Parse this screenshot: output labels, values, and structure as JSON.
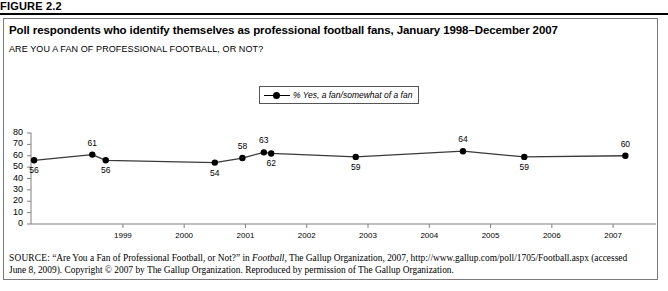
{
  "figure": {
    "label": "FIGURE 2.2",
    "title": "Poll respondents who identify themselves as professional football fans, January 1998–December 2007",
    "subtitle": "ARE YOU A FAN OF PROFESSIONAL FOOTBALL, OR NOT?"
  },
  "legend": {
    "series_label": "% Yes, a fan/somewhat of a fan",
    "position": "top-center"
  },
  "source": {
    "keyword": "SOURCE",
    "text_before_italic": ": “Are You a Fan of Professional Football, or Not?” in ",
    "italic_title": "Football,",
    "text_after_italic": " The Gallup Organization, 2007, http://www.gallup.com/poll/1705/Football.aspx (accessed June 8, 2009). Copyright © 2007 by The Gallup Organization. Reproduced by permission of The Gallup Organization."
  },
  "colors": {
    "line": "#3a3a3a",
    "marker": "#000000",
    "axis": "#808080",
    "border": "#7a7a7a",
    "background": "#ffffff"
  },
  "chart_data": {
    "type": "line",
    "title": "Poll respondents who identify themselves as professional football fans, January 1998–December 2007",
    "subtitle": "ARE YOU A FAN OF PROFESSIONAL FOOTBALL, OR NOT?",
    "xlabel": "",
    "ylabel": "",
    "ylim": [
      0,
      80
    ],
    "yticks": [
      0,
      10,
      20,
      30,
      40,
      50,
      60,
      70,
      80
    ],
    "xticks": [
      "1999",
      "2000",
      "2001",
      "2002",
      "2003",
      "2004",
      "2005",
      "2006",
      "2007"
    ],
    "grid": false,
    "legend": "% Yes, a fan/somewhat of a fan",
    "series": [
      {
        "name": "% Yes, a fan/somewhat of a fan",
        "points": [
          {
            "x": 1998.05,
            "y": 56,
            "label": "56",
            "label_pos": "below"
          },
          {
            "x": 1999.0,
            "y": 61,
            "label": "61",
            "label_pos": "above"
          },
          {
            "x": 1999.22,
            "y": 56,
            "label": "56",
            "label_pos": "below"
          },
          {
            "x": 2001.0,
            "y": 54,
            "label": "54",
            "label_pos": "below"
          },
          {
            "x": 2001.45,
            "y": 58,
            "label": "58",
            "label_pos": "above"
          },
          {
            "x": 2001.8,
            "y": 63,
            "label": "63",
            "label_pos": "above"
          },
          {
            "x": 2001.92,
            "y": 62,
            "label": "62",
            "label_pos": "below"
          },
          {
            "x": 2003.3,
            "y": 59,
            "label": "59",
            "label_pos": "below"
          },
          {
            "x": 2005.05,
            "y": 64,
            "label": "64",
            "label_pos": "above"
          },
          {
            "x": 2006.05,
            "y": 59,
            "label": "59",
            "label_pos": "below"
          },
          {
            "x": 2007.7,
            "y": 60,
            "label": "60",
            "label_pos": "above"
          }
        ]
      }
    ]
  }
}
